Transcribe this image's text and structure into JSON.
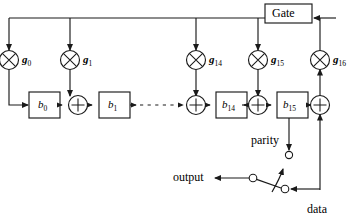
{
  "diagram": {
    "stroke_color": "#1a1a1a",
    "fill_color": "#ffffff",
    "gate": {
      "label": "Gate"
    },
    "taps": [
      {
        "name": "g0",
        "label": "g",
        "subscript": "0",
        "icon": "xor-multiply-icon"
      },
      {
        "name": "g1",
        "label": "g",
        "subscript": "1",
        "icon": "xor-multiply-icon"
      },
      {
        "name": "g14",
        "label": "g",
        "subscript": "14",
        "icon": "xor-multiply-icon"
      },
      {
        "name": "g15",
        "label": "g",
        "subscript": "15",
        "icon": "xor-multiply-icon"
      },
      {
        "name": "g16",
        "label": "g",
        "subscript": "16",
        "icon": "xor-multiply-icon"
      }
    ],
    "registers": [
      {
        "name": "b0",
        "label": "b",
        "subscript": "0"
      },
      {
        "name": "b1",
        "label": "b",
        "subscript": "1"
      },
      {
        "name": "b14",
        "label": "b",
        "subscript": "14"
      },
      {
        "name": "b15",
        "label": "b",
        "subscript": "15"
      }
    ],
    "adders": [
      {
        "name": "adder-after-b0",
        "symbol": "+"
      },
      {
        "name": "adder-before-b14",
        "symbol": "+"
      },
      {
        "name": "adder-after-b14",
        "symbol": "+"
      },
      {
        "name": "adder-output",
        "symbol": "+"
      }
    ],
    "signals": {
      "parity": "parity",
      "output": "output",
      "data": "data"
    },
    "ellipsis": {
      "style": "dashed",
      "meaning": "registers b2 through b13 omitted"
    },
    "switch": {
      "name": "mode-switch",
      "position": "data",
      "terminals": [
        "parity",
        "data"
      ]
    }
  }
}
